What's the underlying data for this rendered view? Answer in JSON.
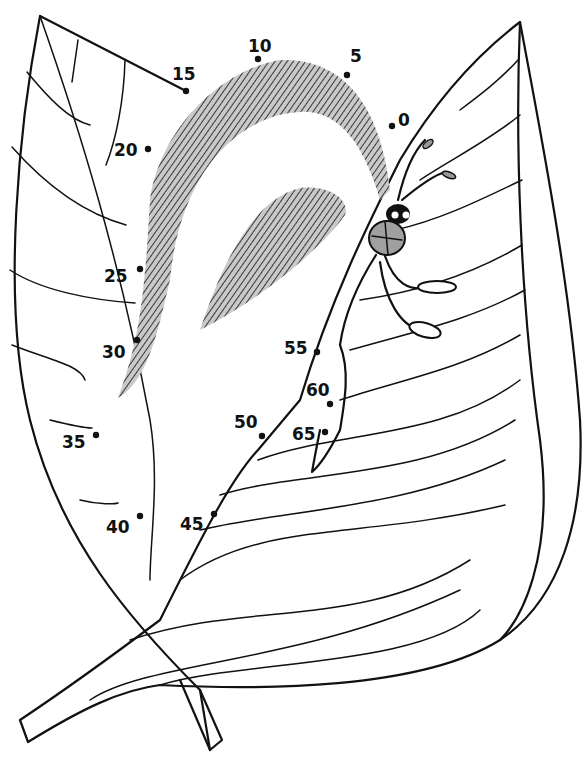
{
  "page": {
    "colors": {
      "ink": "#111111",
      "shade": "#c9c9c9",
      "insect_body": "#a0a0a0",
      "background": "#ffffff"
    }
  },
  "dots": [
    {
      "label": "0",
      "x": 392,
      "y": 126,
      "lx": 398,
      "ly": 126
    },
    {
      "label": "5",
      "x": 347,
      "y": 75,
      "lx": 350,
      "ly": 62
    },
    {
      "label": "10",
      "x": 258,
      "y": 59,
      "lx": 248,
      "ly": 52
    },
    {
      "label": "15",
      "x": 186,
      "y": 91,
      "lx": 172,
      "ly": 80
    },
    {
      "label": "20",
      "x": 148,
      "y": 149,
      "lx": 114,
      "ly": 156
    },
    {
      "label": "25",
      "x": 140,
      "y": 269,
      "lx": 104,
      "ly": 282
    },
    {
      "label": "30",
      "x": 137,
      "y": 340,
      "lx": 102,
      "ly": 358
    },
    {
      "label": "35",
      "x": 96,
      "y": 435,
      "lx": 62,
      "ly": 448
    },
    {
      "label": "40",
      "x": 140,
      "y": 516,
      "lx": 106,
      "ly": 533
    },
    {
      "label": "45",
      "x": 214,
      "y": 514,
      "lx": 180,
      "ly": 530
    },
    {
      "label": "50",
      "x": 262,
      "y": 436,
      "lx": 234,
      "ly": 428
    },
    {
      "label": "55",
      "x": 317,
      "y": 352,
      "lx": 284,
      "ly": 354
    },
    {
      "label": "60",
      "x": 330,
      "y": 404,
      "lx": 306,
      "ly": 396
    },
    {
      "label": "65",
      "x": 325,
      "y": 432,
      "lx": 292,
      "ly": 440
    }
  ]
}
